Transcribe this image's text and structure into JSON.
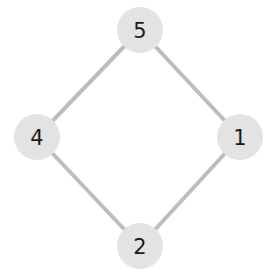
{
  "diagram": {
    "background_color": "#ffffff",
    "node_fill_color": "#e3e3e3",
    "node_label_color": "#1a1a1a",
    "edge_color": "#bdbdbd",
    "edge_width": 4,
    "node_radius": 23,
    "nodes": [
      {
        "id": "5",
        "label": "5",
        "cx": 140,
        "cy": 30
      },
      {
        "id": "4",
        "label": "4",
        "cx": 37,
        "cy": 137
      },
      {
        "id": "1",
        "label": "1",
        "cx": 240,
        "cy": 137
      },
      {
        "id": "2",
        "label": "2",
        "cx": 140,
        "cy": 246
      }
    ],
    "edges": [
      {
        "source": "5",
        "target": "4"
      },
      {
        "source": "5",
        "target": "1"
      },
      {
        "source": "4",
        "target": "2"
      },
      {
        "source": "2",
        "target": "1"
      }
    ]
  }
}
